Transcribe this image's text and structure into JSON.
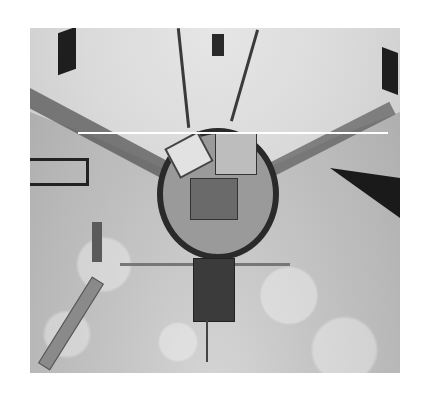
{
  "image": {
    "description": "Black-and-white photograph of a spacecraft payload bay viewed from above, with a satellite payload deploying and a robotic arm on the left, Earth's cloud-covered surface in the background",
    "caption": ""
  }
}
